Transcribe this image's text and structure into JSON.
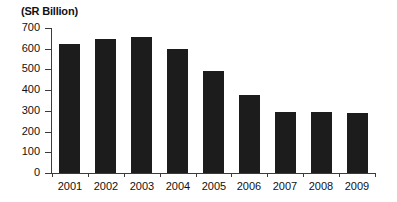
{
  "chart_data": {
    "type": "bar",
    "title": "(SR Billion)",
    "xlabel": "",
    "ylabel": "",
    "categories": [
      "2001",
      "2002",
      "2003",
      "2004",
      "2005",
      "2006",
      "2007",
      "2008",
      "2009"
    ],
    "values": [
      625,
      645,
      655,
      600,
      490,
      375,
      295,
      293,
      288
    ],
    "ylim": [
      0,
      700
    ],
    "ytick_labels": [
      "700",
      "600",
      "500",
      "400",
      "300",
      "200",
      "100",
      "0"
    ],
    "ytick_values": [
      700,
      600,
      500,
      400,
      300,
      200,
      100,
      0
    ],
    "grid": false,
    "legend": null,
    "bar_color": "#1c1c1c",
    "axis_color": "#3b3b3b",
    "background": "#ffffff"
  }
}
